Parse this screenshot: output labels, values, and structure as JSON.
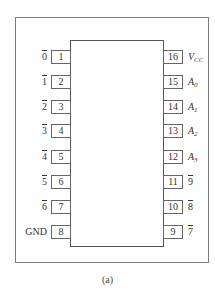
{
  "diagram": {
    "type": "IC pinout (16-pin DIP)",
    "caption": "(a)",
    "left_pins": [
      {
        "number": "1",
        "label": "0",
        "overbar": true
      },
      {
        "number": "2",
        "label": "1",
        "overbar": true
      },
      {
        "number": "3",
        "label": "2",
        "overbar": true
      },
      {
        "number": "4",
        "label": "3",
        "overbar": true
      },
      {
        "number": "5",
        "label": "4",
        "overbar": true
      },
      {
        "number": "6",
        "label": "5",
        "overbar": true
      },
      {
        "number": "7",
        "label": "6",
        "overbar": true
      },
      {
        "number": "8",
        "label": "GND",
        "overbar": false
      }
    ],
    "right_pins": [
      {
        "number": "16",
        "label": "V",
        "sub": "CC",
        "italic": true
      },
      {
        "number": "15",
        "label": "A",
        "sub": "0",
        "italic": true
      },
      {
        "number": "14",
        "label": "A",
        "sub": "1",
        "italic": true
      },
      {
        "number": "13",
        "label": "A",
        "sub": "2",
        "italic": true
      },
      {
        "number": "12",
        "label": "A",
        "sub": "3",
        "italic": true
      },
      {
        "number": "11",
        "label": "9",
        "overbar": true
      },
      {
        "number": "10",
        "label": "8",
        "overbar": true
      },
      {
        "number": "9",
        "label": "7",
        "overbar": true
      }
    ]
  }
}
